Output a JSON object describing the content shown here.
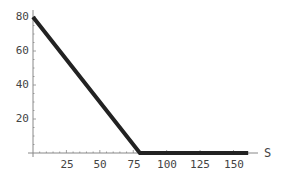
{
  "chart_data": {
    "type": "line",
    "title": "",
    "xlabel": "S",
    "ylabel": "",
    "xlim": [
      0,
      160
    ],
    "ylim": [
      0,
      82
    ],
    "grid": false,
    "legend": null,
    "x_ticks": [
      25,
      50,
      75,
      100,
      125,
      150
    ],
    "y_ticks": [
      20,
      40,
      60,
      80
    ],
    "series": [
      {
        "name": "payoff",
        "color": "#222222",
        "x": [
          0,
          80,
          161
        ],
        "y": [
          80,
          0,
          0
        ]
      }
    ]
  },
  "labels": {
    "x_axis": "S",
    "x_ticks": [
      "25",
      "50",
      "75",
      "100",
      "125",
      "150"
    ],
    "y_ticks": [
      "20",
      "40",
      "60",
      "80"
    ]
  }
}
